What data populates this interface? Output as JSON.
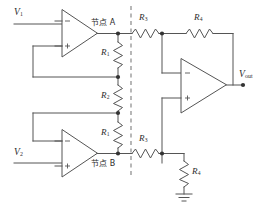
{
  "diagram": {
    "stroke_color": "#555555",
    "label_color": "#2b2b2b",
    "divider_color": "#9a9a9a",
    "background": "#ffffff"
  },
  "labels": {
    "input_v1": {
      "base": "V",
      "sub": "1"
    },
    "input_v2": {
      "base": "V",
      "sub": "2"
    },
    "output_vout": {
      "base": "V",
      "sub": "out"
    },
    "node_a": "节点 A",
    "node_b": "节点 B",
    "r1_top": {
      "base": "R",
      "sub": "1"
    },
    "r2_mid": {
      "base": "R",
      "sub": "2"
    },
    "r1_bottom": {
      "base": "R",
      "sub": "1"
    },
    "r3_top": {
      "base": "R",
      "sub": "3"
    },
    "r4_feedback": {
      "base": "R",
      "sub": "4"
    },
    "r3_bottom": {
      "base": "R",
      "sub": "3"
    },
    "r4_ground": {
      "base": "R",
      "sub": "4"
    }
  },
  "opamps": {
    "u1": {
      "name": "buffer-amplifier-top",
      "inverting": "−",
      "noninverting": "+"
    },
    "u2": {
      "name": "buffer-amplifier-bottom",
      "inverting": "−",
      "noninverting": "+"
    },
    "u3": {
      "name": "difference-amplifier",
      "inverting": "−",
      "noninverting": "+"
    }
  },
  "symbols": {
    "ground": "ground-symbol",
    "junction": "junction-dot",
    "divider": "stage-divider-dashed-line"
  }
}
